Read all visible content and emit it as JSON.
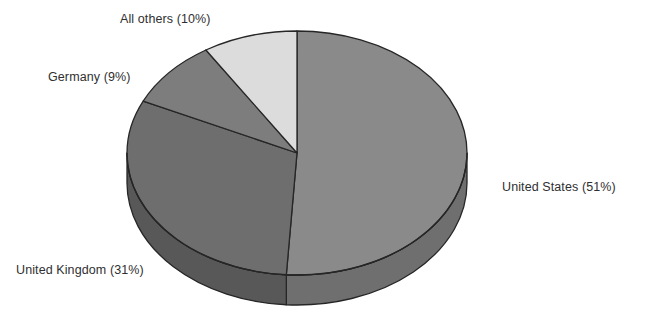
{
  "chart_data": {
    "type": "pie",
    "title": "",
    "subtitle": "",
    "xlabel": "",
    "ylabel": "",
    "legend_position": "none",
    "grid": false,
    "style": "3d-pie",
    "unit": "%",
    "categories": [
      "United States",
      "United Kingdom",
      "Germany",
      "All others"
    ],
    "values": [
      51,
      31,
      9,
      10
    ],
    "slices": [
      {
        "name": "United States",
        "value": 51,
        "label": "United States (51%)",
        "color": "#8a8a8a",
        "side_color": "#6f6f6f",
        "start_pct": 0,
        "end_pct": 51
      },
      {
        "name": "United Kingdom",
        "value": 31,
        "label": "United Kingdom (31%)",
        "color": "#6e6e6e",
        "side_color": "#585858",
        "start_pct": 51,
        "end_pct": 82
      },
      {
        "name": "Germany",
        "value": 9,
        "label": "Germany (9%)",
        "color": "#7d7d7d",
        "side_color": "#656565",
        "start_pct": 82,
        "end_pct": 91
      },
      {
        "name": "All others",
        "value": 10,
        "label": "All others (10%)",
        "color": "#dcdcdc",
        "side_color": "#b5b5b5",
        "start_pct": 91,
        "end_pct": 100
      }
    ],
    "annotations": [
      {
        "text": "All others (10%)",
        "target": "All others"
      },
      {
        "text": "Germany (9%)",
        "target": "Germany"
      },
      {
        "text": "United Kingdom (31%)",
        "target": "United Kingdom"
      },
      {
        "text": "United States (51%)",
        "target": "United States"
      }
    ],
    "colors": {
      "background": "#ffffff",
      "outline": "#262626",
      "text": "#2f2f2f"
    }
  },
  "labels": {
    "all_others": "All others (10%)",
    "germany": "Germany (9%)",
    "united_kingdom": "United Kingdom (31%)",
    "united_states": "United States (51%)"
  }
}
